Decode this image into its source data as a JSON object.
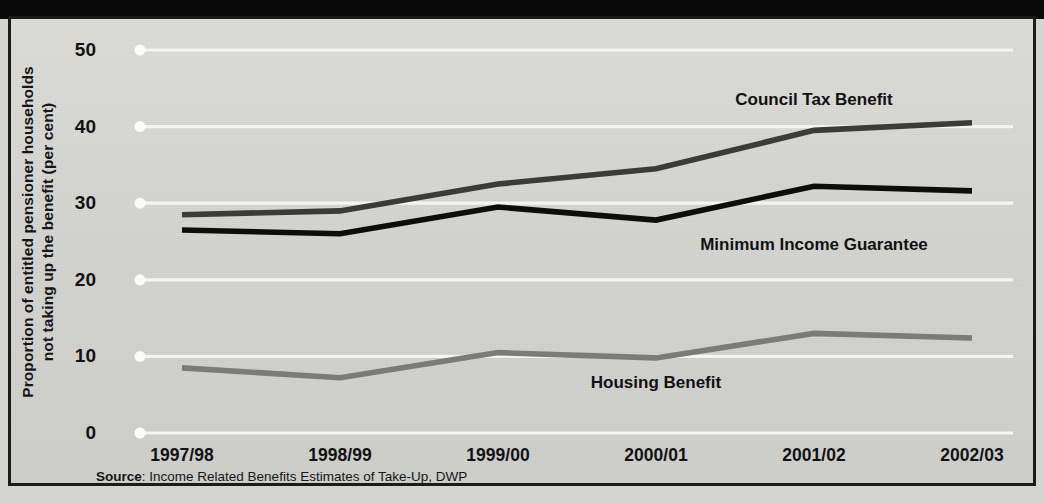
{
  "figure": {
    "background_color": "#d4d4d0",
    "frame_color": "#1b1b1b",
    "title_band_color": "#0a0a0a"
  },
  "source_note": {
    "prefix": "Source",
    "separator": ": ",
    "text": "Income Related Benefits Estimates of Take-Up, DWP"
  },
  "axis": {
    "ylabel_line1": "Proportion of entitled pensioner households",
    "ylabel_line2": "not taking up the benefit (per cent)",
    "yticks": [
      "0",
      "10",
      "20",
      "30",
      "40",
      "50"
    ],
    "xticks": [
      "1997/98",
      "1998/99",
      "1999/00",
      "2000/01",
      "2001/02",
      "2002/03"
    ]
  },
  "chart_data": {
    "type": "line",
    "title": "",
    "xlabel": "",
    "ylabel": "Proportion of entitled pensioner households not taking up the benefit (per cent)",
    "categories": [
      "1997/98",
      "1998/99",
      "1999/00",
      "2000/01",
      "2001/02",
      "2002/03"
    ],
    "ylim": [
      0,
      50
    ],
    "yticks": [
      0,
      10,
      20,
      30,
      40,
      50
    ],
    "grid": true,
    "grid_color": "#f4f4f2",
    "legend_position": "inline-annotations",
    "series": [
      {
        "name": "Council Tax Benefit",
        "color": "#3b3b3b",
        "values": [
          28.5,
          29.0,
          32.5,
          34.5,
          39.5,
          40.5
        ],
        "label_x_category": "2001/02",
        "label_value": 43.5
      },
      {
        "name": "Minimum Income Guarantee",
        "color": "#0d0d0d",
        "values": [
          26.5,
          26.0,
          29.5,
          27.8,
          32.2,
          31.6
        ],
        "label_x_category": "2001/02",
        "label_value": 24.5
      },
      {
        "name": "Housing Benefit",
        "color": "#7b7b7b",
        "values": [
          8.5,
          7.2,
          10.5,
          9.8,
          13.0,
          12.4
        ],
        "label_x_category": "2000/01",
        "label_value": 6.5
      }
    ]
  }
}
